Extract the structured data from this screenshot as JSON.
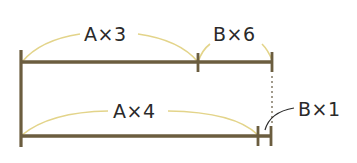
{
  "diagram": {
    "type": "segment-bar-model",
    "colors": {
      "bar": "#6b5d3f",
      "arc": "#e3d48a",
      "text": "#2a2a2a",
      "dotted": "#8a8270",
      "leader": "#2a2a2a"
    },
    "top_bar": {
      "segments": [
        {
          "label": "A×3"
        },
        {
          "label": "B×6"
        }
      ]
    },
    "bottom_bar": {
      "segments": [
        {
          "label": "A×4"
        },
        {
          "label": "B×1"
        }
      ]
    }
  }
}
